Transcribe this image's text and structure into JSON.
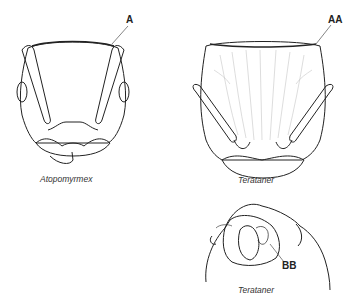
{
  "figure": {
    "panels": [
      {
        "id": "left-top",
        "caption": "Atopomyrmex",
        "label": "A"
      },
      {
        "id": "right-top",
        "caption": "Terataner",
        "label": "AA"
      },
      {
        "id": "right-bottom",
        "caption": "Terataner",
        "label": "BB"
      }
    ]
  },
  "colors": {
    "line": "#222222",
    "sculpture": "#bbbbbb",
    "background": "#ffffff"
  }
}
